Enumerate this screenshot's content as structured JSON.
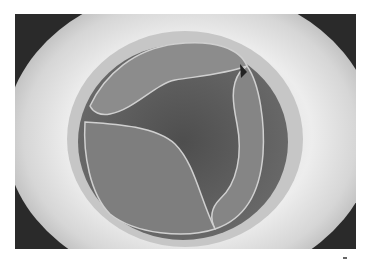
{
  "image": {
    "subject": "valve-leaflets-viewed-through-circular-ring",
    "description": "Grayscale photograph of a three-leaflet valve inside a bright circular housing",
    "colors": {
      "background": "#ffffff",
      "frame_dark": "#2a2a2a",
      "outer_ring": "#d9d9d9",
      "inner_ring": "#bdbdbd",
      "lumen": "#5a5a5a",
      "leaflet": "#8a8a8a",
      "leaflet_edge": "#cfcfcf"
    }
  }
}
